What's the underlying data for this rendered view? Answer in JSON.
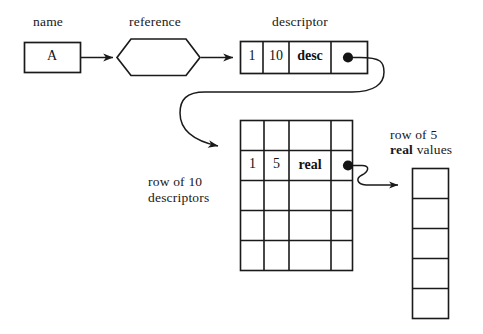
{
  "diagram": {
    "ink_color": "#1a1a1a",
    "background_color": "#ffffff",
    "labels": {
      "name": "name",
      "reference": "reference",
      "descriptor": "descriptor",
      "row_of_10_descriptors": "row of 10\ndescriptors",
      "row_of_5_prefix": "row of 5",
      "row_of_5_bold": "real",
      "row_of_5_suffix": "values"
    },
    "name_box": {
      "value": "A"
    },
    "reference_node": {
      "shape": "hexagon",
      "value": ""
    },
    "descriptor_record": {
      "cells": [
        {
          "value": "1",
          "style": "plain"
        },
        {
          "value": "10",
          "style": "plain"
        },
        {
          "value": "desc",
          "style": "bold"
        },
        {
          "value": "",
          "style": "pointer"
        }
      ]
    },
    "descriptor_grid": {
      "rows": 5,
      "columns": 4,
      "filled_row_index": 1,
      "filled_row": [
        {
          "value": "1",
          "style": "plain"
        },
        {
          "value": "5",
          "style": "plain"
        },
        {
          "value": "real",
          "style": "bold"
        },
        {
          "value": "",
          "style": "pointer"
        }
      ],
      "empty_cell_value": ""
    },
    "values_column": {
      "count": 5,
      "cells": [
        "",
        "",
        "",
        "",
        ""
      ]
    },
    "arrows": [
      {
        "from": "name-box",
        "to": "reference-hexagon",
        "type": "straight"
      },
      {
        "from": "reference-hexagon",
        "to": "descriptor-record",
        "type": "straight"
      },
      {
        "from": "descriptor-pointer",
        "to": "descriptor-grid-row",
        "type": "curved-loop"
      },
      {
        "from": "grid-row-pointer",
        "to": "values-column",
        "type": "curved-s"
      }
    ]
  }
}
